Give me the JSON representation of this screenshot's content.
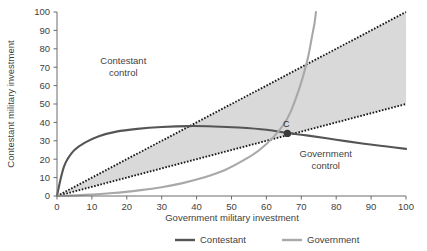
{
  "chart_data": {
    "type": "line",
    "title": "",
    "xlabel": "Government military investment",
    "ylabel": "Contestant military investment",
    "xlim": [
      0,
      100
    ],
    "ylim": [
      0,
      100
    ],
    "grid": false,
    "legend_position": "bottom",
    "xticks": [
      "0",
      "10",
      "20",
      "30",
      "40",
      "50",
      "60",
      "70",
      "80",
      "90",
      "100"
    ],
    "yticks": [
      "0",
      "10",
      "20",
      "30",
      "40",
      "50",
      "60",
      "70",
      "80",
      "90",
      "100"
    ],
    "xtick_values": [
      0,
      10,
      20,
      30,
      40,
      50,
      60,
      70,
      80,
      90,
      100
    ],
    "ytick_values": [
      0,
      10,
      20,
      30,
      40,
      50,
      60,
      70,
      80,
      90,
      100
    ],
    "series": [
      {
        "name": "Contestant",
        "style": "solid",
        "color": "#555555",
        "x": [
          0,
          1,
          2,
          3,
          5,
          8,
          12,
          17,
          23,
          30,
          38,
          45,
          52,
          60,
          66,
          72,
          80,
          88,
          94,
          100
        ],
        "values": [
          0,
          9,
          16,
          20,
          25,
          29,
          32.5,
          35,
          36.5,
          37.5,
          38,
          37.8,
          37.2,
          36,
          34.3,
          32.8,
          30.6,
          28.4,
          27,
          25.6
        ]
      },
      {
        "name": "Government",
        "style": "solid",
        "color": "#a8a8a8",
        "x": [
          0,
          8,
          16,
          24,
          30,
          36,
          42,
          48,
          54,
          58,
          62,
          65,
          67,
          69,
          70.5,
          72,
          73,
          73.8,
          74.2
        ],
        "values": [
          0,
          0.6,
          1.6,
          3.2,
          4.8,
          7.0,
          10.0,
          14.0,
          20.0,
          25.0,
          32.0,
          39.0,
          46.0,
          56.0,
          65.0,
          76.0,
          86.0,
          94.0,
          100
        ]
      }
    ],
    "reference_lines": [
      {
        "name": "upper-boundary",
        "style": "dotted",
        "color": "#1a1a1a",
        "slope": 1.0,
        "from": [
          0,
          0
        ],
        "to": [
          100,
          100
        ]
      },
      {
        "name": "lower-boundary",
        "style": "dotted",
        "color": "#1a1a1a",
        "slope": 0.5,
        "from": [
          0,
          0
        ],
        "to": [
          100,
          50
        ]
      }
    ],
    "shaded_region": {
      "name": "contested-wedge",
      "color": "#d9d9d9",
      "between": [
        "lower-boundary",
        "upper-boundary"
      ]
    },
    "annotations": [
      {
        "name": "contestant-control",
        "text_line1": "Contestant",
        "text_line2": "control",
        "x": 19,
        "y": 72
      },
      {
        "name": "government-control",
        "text_line1": "Government",
        "text_line2": "control",
        "x": 77,
        "y": 21
      }
    ],
    "points": [
      {
        "name": "equilibrium",
        "label": "C",
        "x": 66,
        "y": 34
      }
    ]
  },
  "legend": {
    "items": [
      {
        "label": "Contestant",
        "color": "#555555"
      },
      {
        "label": "Government",
        "color": "#a8a8a8"
      }
    ]
  }
}
